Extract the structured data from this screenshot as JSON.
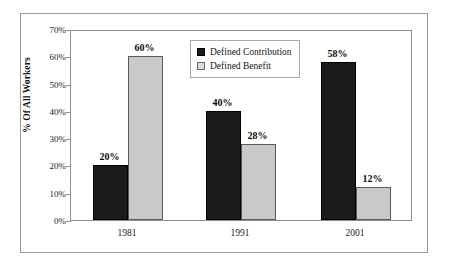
{
  "chart_data": {
    "type": "bar",
    "title": "",
    "xlabel": "",
    "ylabel": "% Of All Workers",
    "categories": [
      "1981",
      "1991",
      "2001"
    ],
    "ylim": [
      0,
      70
    ],
    "ytick_labels": [
      "0%",
      "10%",
      "20%",
      "30%",
      "40%",
      "50%",
      "60%",
      "70%"
    ],
    "ytick_values": [
      0,
      10,
      20,
      30,
      40,
      50,
      60,
      70
    ],
    "grid": false,
    "legend_position": "top-center",
    "series": [
      {
        "name": "Defined Contribution",
        "color": "#1b1b1b",
        "values": [
          20,
          40,
          58
        ],
        "data_labels": [
          "20%",
          "40%",
          "58%"
        ]
      },
      {
        "name": "Defined Benefit",
        "color": "#c9c9c9",
        "values": [
          60,
          28,
          12
        ],
        "data_labels": [
          "60%",
          "28%",
          "12%"
        ]
      }
    ]
  }
}
